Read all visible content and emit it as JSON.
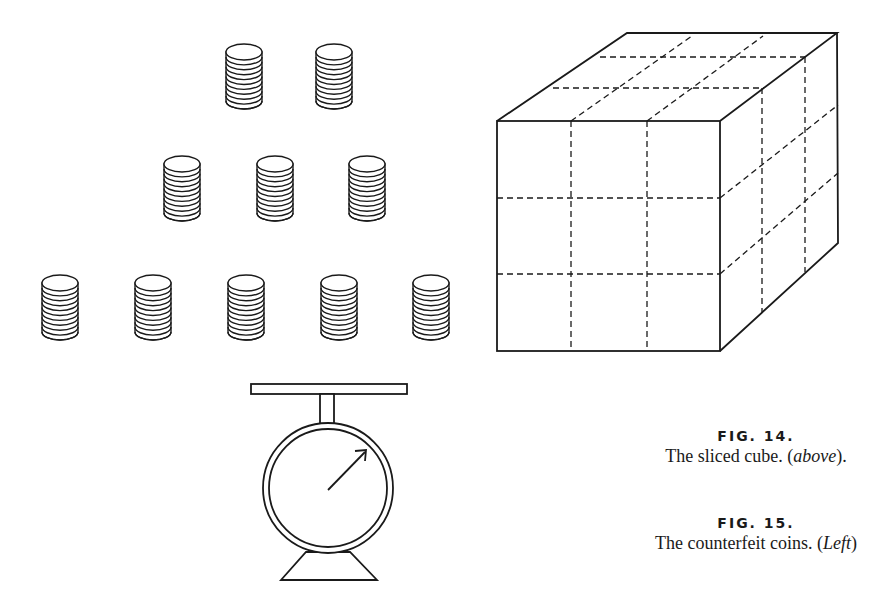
{
  "figures": {
    "fig14": {
      "label": "FIG. 14.",
      "caption_main": "The sliced cube. (",
      "caption_italic": "above",
      "caption_end": ")."
    },
    "fig15": {
      "label": "FIG. 15.",
      "caption_main": "The counterfeit coins. (",
      "caption_italic": "Left",
      "caption_end": ")"
    }
  },
  "coins": {
    "rows": [
      {
        "count": 2,
        "centers_x": [
          244,
          334
        ],
        "top_y": 44
      },
      {
        "count": 3,
        "centers_x": [
          182,
          275,
          367
        ],
        "top_y": 156
      },
      {
        "count": 5,
        "centers_x": [
          60,
          153,
          246,
          339,
          431
        ],
        "top_y": 275
      }
    ],
    "stack_height_discs": 11
  },
  "cube": {
    "slices_per_axis": 3,
    "total_pieces": 27
  },
  "scale": {
    "needle_direction": "upper-right"
  },
  "colors": {
    "ink": "#1a1a1a",
    "paper": "#ffffff"
  }
}
